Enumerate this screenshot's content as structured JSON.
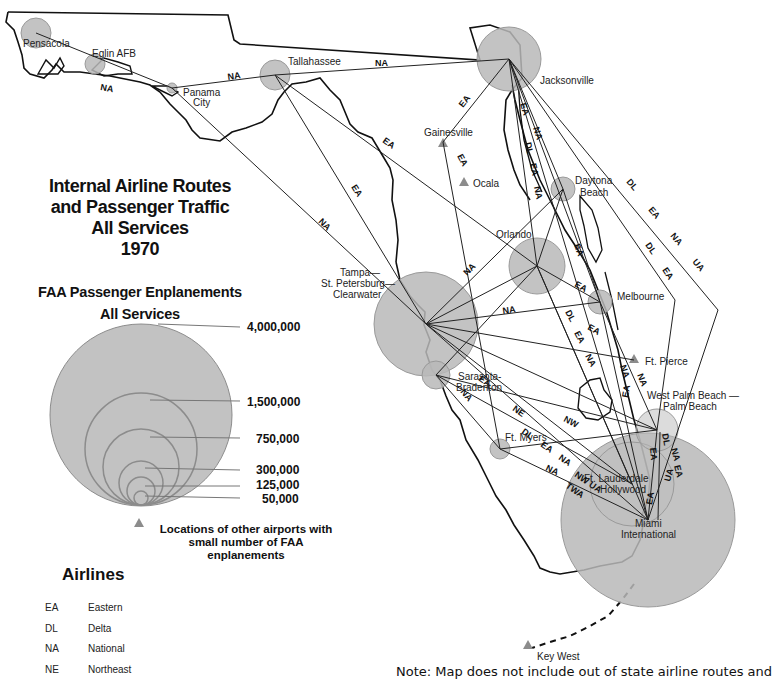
{
  "title": {
    "lines": [
      "Internal Airline Routes",
      "and Passenger Traffic",
      "All Services",
      "1970"
    ]
  },
  "legend": {
    "enplanements_title": [
      "FAA Passenger Enplanements",
      "All Services"
    ],
    "scale": [
      {
        "value": "4,000,000"
      },
      {
        "value": "1,500,000"
      },
      {
        "value": "750,000"
      },
      {
        "value": "300,000"
      },
      {
        "value": "125,000"
      },
      {
        "value": "50,000"
      }
    ],
    "other_airports_note": [
      "Locations of other airports with",
      "small number of FAA",
      "enplanements"
    ],
    "airlines_title": "Airlines",
    "airlines": [
      {
        "code": "EA",
        "name": "Eastern"
      },
      {
        "code": "DL",
        "name": "Delta"
      },
      {
        "code": "NA",
        "name": "National"
      },
      {
        "code": "NE",
        "name": "Northeast"
      }
    ]
  },
  "cities": {
    "pensacola": "Pensacola",
    "eglin": "Eglin AFB",
    "panama_city_1": "Panama",
    "panama_city_2": "City",
    "tallahassee": "Tallahassee",
    "jacksonville": "Jacksonville",
    "gainesville": "Gainesville",
    "ocala": "Ocala",
    "daytona_1": "Daytona",
    "daytona_2": "Beach",
    "orlando": "Orlando",
    "tampa_1": "Tampa—",
    "tampa_2": "St. Petersburg—",
    "tampa_3": "Clearwater",
    "melbourne": "Melbourne",
    "ft_pierce": "Ft. Pierce",
    "sarasota_1": "Sarasota-",
    "sarasota_2": "Bradenton",
    "wpb_1": "West Palm Beach —",
    "wpb_2": "Palm Beach",
    "ft_myers": "Ft. Myers",
    "ftl_1": "Ft. Lauderdale",
    "ftl_2": "Hollywood",
    "miami_1": "Miami",
    "miami_2": "International",
    "key_west": "Key West"
  },
  "route_labels": {
    "pns_pfn": "NA",
    "pfn_tlh": "NA",
    "tlh_jax": "NA",
    "tlh_orl": "EA",
    "tlh_tpa": "EA",
    "pfn_tpa": "NA",
    "jax_gnv": "EA",
    "gnv_oca": "EA",
    "jax_s1": "EA",
    "jax_s2": "NA",
    "jax_s3": "DL",
    "jax_s4": "EA",
    "jax_s5": "NA",
    "jax_e1": "DL",
    "jax_e2": "EA",
    "jax_e3": "NA",
    "jax_e4": "UA",
    "jax_e5": "DL",
    "jax_e6": "EA",
    "tpa_dab": "NA",
    "dab_mlb": "EA",
    "orl_mlb": "EA",
    "tpa_mlb": "NA",
    "orl_s1": "DL",
    "orl_s2": "EA",
    "orl_s3": "NA",
    "tpa_fpr": "EA",
    "mlb_s1": "NA",
    "mlb_s2": "NA",
    "mlb_s3": "EA",
    "tpa_mia1": "EA",
    "tpa_mia2": "NE",
    "srq_mia1": "DL",
    "srq_mia2": "EA",
    "srq_mia3": "NA",
    "srq_pbi": "NW",
    "srq_fmy": "NA",
    "tpa_mia3": "NW UA",
    "tpa_mia4": "TWA",
    "fmy_mia": "NA",
    "pbi_mia1": "DL",
    "pbi_mia2": "NA",
    "pbi_mia3": "EA",
    "pbi_mia4": "UA",
    "pbi_mia5": "EA",
    "fll_mia": "EA"
  },
  "note": "Note: Map does not include out of state airline routes and",
  "colors": {
    "circle_fill": "#b9b9b9",
    "circle_stroke": "#9a9a9a",
    "triangle": "#8c8c8c",
    "coast": "#111111",
    "route": "#222222"
  }
}
